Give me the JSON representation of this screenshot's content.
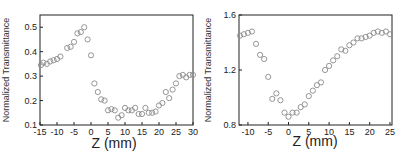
{
  "chart_data": [
    {
      "type": "scatter",
      "title": "",
      "xlabel": "Z (mm)",
      "ylabel": "Normalized Transmittance",
      "xlim": [
        -15,
        30
      ],
      "ylim": [
        0.1,
        0.55
      ],
      "xticks": [
        -15,
        -10,
        -5,
        0,
        5,
        10,
        15,
        20,
        25,
        30
      ],
      "yticks": [
        0.1,
        0.2,
        0.3,
        0.4,
        0.5
      ],
      "xtick_labels": [
        "-15",
        "-10",
        "-5",
        "0",
        "5",
        "10",
        "15",
        "20",
        "25",
        "30"
      ],
      "ytick_labels": [
        "0.1",
        "0.2",
        "0.3",
        "0.4",
        "0.5"
      ],
      "grid": false,
      "legend": null,
      "marker": "open-circle",
      "x": [
        -15,
        -14,
        -13,
        -12,
        -11,
        -10,
        -9,
        -7,
        -6,
        -5,
        -4,
        -3,
        -2,
        -1,
        0,
        1,
        2,
        3,
        4,
        5,
        6,
        7,
        8,
        9,
        10,
        11,
        12,
        13,
        14,
        15,
        16,
        17,
        18,
        19,
        20,
        21,
        22,
        23,
        24,
        25,
        26,
        27,
        28,
        29,
        30
      ],
      "y": [
        0.345,
        0.355,
        0.35,
        0.36,
        0.365,
        0.37,
        0.38,
        0.415,
        0.42,
        0.44,
        0.475,
        0.48,
        0.5,
        0.45,
        0.385,
        0.27,
        0.235,
        0.205,
        0.2,
        0.16,
        0.165,
        0.16,
        0.13,
        0.14,
        0.17,
        0.16,
        0.16,
        0.17,
        0.145,
        0.145,
        0.17,
        0.15,
        0.15,
        0.155,
        0.18,
        0.19,
        0.235,
        0.21,
        0.245,
        0.27,
        0.3,
        0.305,
        0.295,
        0.305,
        0.305
      ]
    },
    {
      "type": "scatter",
      "title": "",
      "xlabel": "Z (mm)",
      "ylabel": "Normalized Transmittance",
      "xlim": [
        -12.2,
        25.5
      ],
      "ylim": [
        0.8,
        1.6
      ],
      "xticks": [
        -10,
        -5,
        0,
        5,
        10,
        15,
        20,
        25
      ],
      "yticks": [
        0.8,
        1.2,
        1.6
      ],
      "xtick_labels": [
        "-10",
        "-5",
        "0",
        "5",
        "10",
        "15",
        "20",
        "25"
      ],
      "ytick_labels": [
        "0.8",
        "1.2",
        "1.6"
      ],
      "grid": false,
      "legend": null,
      "marker": "open-circle",
      "x": [
        -12,
        -11,
        -10,
        -9,
        -8,
        -7,
        -6,
        -5,
        -4,
        -3,
        -2,
        -1,
        0,
        1,
        2,
        3,
        4,
        5,
        6,
        7,
        8,
        9,
        10,
        11,
        12,
        13,
        14,
        15,
        16,
        17,
        18,
        19,
        20,
        21,
        22,
        23,
        24,
        25
      ],
      "y": [
        1.45,
        1.46,
        1.47,
        1.48,
        1.39,
        1.31,
        1.28,
        1.15,
        0.99,
        1.03,
        0.98,
        0.89,
        0.86,
        0.89,
        0.89,
        0.93,
        0.95,
        1.01,
        1.05,
        1.09,
        1.11,
        1.2,
        1.23,
        1.27,
        1.3,
        1.35,
        1.34,
        1.38,
        1.4,
        1.43,
        1.43,
        1.44,
        1.45,
        1.47,
        1.48,
        1.47,
        1.48,
        1.46
      ]
    }
  ],
  "charts": [
    {
      "xlabel": "Z (mm)",
      "ylabel": "Normalized Transmittance"
    },
    {
      "xlabel": "Z (mm)",
      "ylabel": "Normalized Transmittance"
    }
  ],
  "colors": {
    "axis": "#222222",
    "marker": "#8a8a8a"
  }
}
